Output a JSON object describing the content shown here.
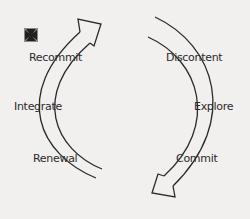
{
  "diagram": {
    "type": "cycle",
    "icon": "cross-pattee-icon",
    "colors": {
      "background": "#f1f0ee",
      "stroke": "#2a2a2a",
      "text": "#2a2a2a"
    },
    "left_arrow": {
      "direction": "upward",
      "labels": [
        "Recommit",
        "Integrate",
        "Renewal"
      ]
    },
    "right_arrow": {
      "direction": "downward",
      "labels": [
        "Discontent",
        "Explore",
        "Commit"
      ]
    },
    "labels": {
      "recommit": "Recommit",
      "integrate": "Integrate",
      "renewal": "Renewal",
      "discontent": "Discontent",
      "explore": "Explore",
      "commit": "Commit"
    }
  }
}
